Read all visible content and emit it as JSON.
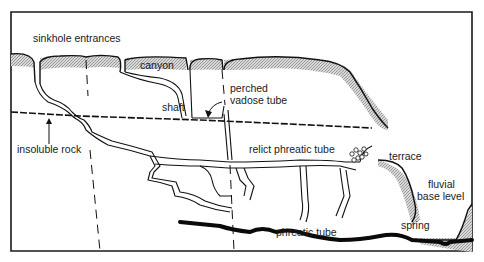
{
  "diagram": {
    "type": "karst cave system cross-section",
    "labels": {
      "sinkhole_entrances": "sinkhole  entrances",
      "canyon": "canyon",
      "perched_line1": "perched",
      "perched_line2": "vadose tube",
      "shaft": "shaft",
      "insoluble_rock": "insoluble rock",
      "relict_phreatic_tube": "relict phreatic tube",
      "terrace": "terrace",
      "fluvial_line1": "fluvial",
      "fluvial_line2": "base level",
      "phreatic_tube": "phreatic tube",
      "spring": "spring"
    },
    "colors": {
      "ink": "#111111",
      "hatch": "#9a9a9a",
      "background": "#ffffff"
    }
  }
}
